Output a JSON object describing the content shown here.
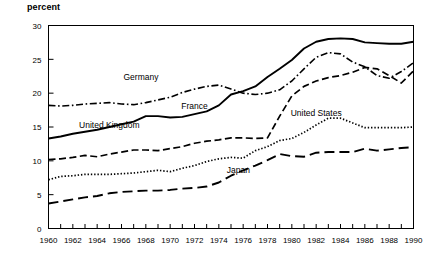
{
  "chart_data": {
    "type": "line",
    "title": "",
    "ylabel": "percent",
    "xlabel": "",
    "ylim": [
      0,
      30
    ],
    "xlim": [
      1960,
      1990
    ],
    "ytick_step": 5,
    "yticks": [
      "0",
      "5",
      "10",
      "15",
      "20",
      "25",
      "30"
    ],
    "grid": false,
    "legend": "inline-annotations",
    "x": [
      1960,
      1961,
      1962,
      1963,
      1964,
      1965,
      1966,
      1967,
      1968,
      1969,
      1970,
      1971,
      1972,
      1973,
      1974,
      1975,
      1976,
      1977,
      1978,
      1979,
      1980,
      1981,
      1982,
      1983,
      1984,
      1985,
      1986,
      1987,
      1988,
      1989,
      1990
    ],
    "xticks": [
      1960,
      1961,
      1962,
      1963,
      1964,
      1965,
      1966,
      1967,
      1968,
      1969,
      1970,
      1971,
      1972,
      1973,
      1974,
      1975,
      1976,
      1977,
      1978,
      1979,
      1980,
      1981,
      1982,
      1983,
      1984,
      1985,
      1986,
      1987,
      1988,
      1989,
      1990
    ],
    "xtick_labels": [
      "1960",
      "",
      "1962",
      "",
      "1964",
      "",
      "1966",
      "",
      "1968",
      "",
      "1970",
      "",
      "1972",
      "",
      "1974",
      "",
      "1976",
      "",
      "1978",
      "",
      "1980",
      "",
      "1982",
      "",
      "1984",
      "",
      "1986",
      "",
      "1988",
      "",
      "1990"
    ],
    "series": [
      {
        "name": "Germany",
        "style": "dash-dot",
        "label_x": 1967.6,
        "label_y": 21.9,
        "values": [
          18.2,
          18.1,
          18.2,
          18.4,
          18.5,
          18.6,
          18.4,
          18.3,
          18.6,
          19.0,
          19.4,
          20.1,
          20.6,
          21.0,
          21.2,
          20.6,
          20.0,
          19.8,
          20.0,
          20.5,
          21.8,
          23.6,
          25.3,
          26.0,
          25.8,
          24.6,
          23.9,
          22.6,
          22.2,
          23.2,
          24.5
        ]
      },
      {
        "name": "France",
        "style": "solid",
        "label_x": 1972.0,
        "label_y": 17.6,
        "values": [
          13.3,
          13.6,
          14.0,
          14.3,
          14.6,
          15.0,
          15.4,
          15.8,
          16.6,
          16.6,
          16.4,
          16.5,
          16.9,
          17.3,
          18.2,
          19.8,
          20.3,
          21.0,
          22.4,
          23.6,
          24.9,
          26.6,
          27.6,
          28.0,
          28.1,
          28.0,
          27.5,
          27.4,
          27.3,
          27.3,
          27.6
        ]
      },
      {
        "name": "United Kingdom",
        "style": "dash",
        "label_x": 1965.0,
        "label_y": 14.9,
        "values": [
          10.2,
          10.3,
          10.5,
          10.8,
          10.6,
          11.0,
          11.3,
          11.6,
          11.6,
          11.5,
          11.8,
          12.1,
          12.6,
          12.9,
          13.1,
          13.4,
          13.4,
          13.3,
          13.4,
          16.6,
          19.6,
          21.0,
          21.8,
          22.3,
          22.6,
          23.1,
          23.8,
          23.6,
          22.6,
          21.5,
          23.3
        ]
      },
      {
        "name": "United States",
        "style": "dot",
        "label_x": 1982.0,
        "label_y": 16.6,
        "values": [
          7.2,
          7.7,
          7.8,
          8.0,
          8.0,
          8.0,
          8.1,
          8.2,
          8.4,
          8.6,
          8.4,
          8.9,
          9.3,
          9.9,
          10.3,
          10.5,
          10.4,
          11.5,
          12.1,
          13.0,
          13.3,
          14.2,
          15.3,
          16.3,
          16.3,
          15.6,
          14.9,
          14.9,
          14.9,
          14.9,
          15.0
        ]
      },
      {
        "name": "Japan",
        "style": "long-dash",
        "label_x": 1975.6,
        "label_y": 8.2,
        "values": [
          3.7,
          4.0,
          4.3,
          4.6,
          4.8,
          5.2,
          5.4,
          5.5,
          5.6,
          5.6,
          5.7,
          5.9,
          6.0,
          6.2,
          6.8,
          7.8,
          8.6,
          9.3,
          10.1,
          11.0,
          10.7,
          10.6,
          11.2,
          11.3,
          11.3,
          11.3,
          11.8,
          11.5,
          11.7,
          11.9,
          12.0
        ]
      }
    ]
  }
}
